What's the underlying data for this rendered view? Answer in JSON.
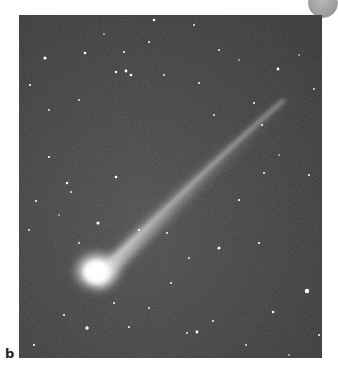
{
  "figure": {
    "panel_label": "b",
    "colors": {
      "sky": "#3c3c3c",
      "comet_head": "#ffffff",
      "tail": "#d8d8d8",
      "corner_button": "#9a9a9a"
    }
  },
  "controls": {
    "corner_button_icon": "circle-button"
  }
}
